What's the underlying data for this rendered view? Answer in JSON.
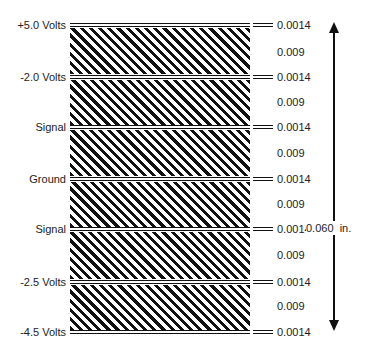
{
  "diagram": {
    "layers": [
      {
        "name": "+5.0 Volts",
        "thickness": "0.0014"
      },
      {
        "name": "-2.0 Volts",
        "thickness": "0.0014"
      },
      {
        "name": "Signal",
        "thickness": "0.0014"
      },
      {
        "name": "Ground",
        "thickness": "0.0014"
      },
      {
        "name": "Signal",
        "thickness": "0.0014"
      },
      {
        "name": "-2.5 Volts",
        "thickness": "0.0014"
      },
      {
        "name": "-4.5 Volts",
        "thickness": "0.0014"
      }
    ],
    "cores": [
      {
        "thickness": "0.009"
      },
      {
        "thickness": "0.009"
      },
      {
        "thickness": "0.009"
      },
      {
        "thickness": "0.009"
      },
      {
        "thickness": "0.009"
      },
      {
        "thickness": "0.009"
      }
    ],
    "total_thickness": "0.060",
    "total_unit": "in.",
    "colors": {
      "line": "#111111",
      "background": "#ffffff"
    }
  }
}
